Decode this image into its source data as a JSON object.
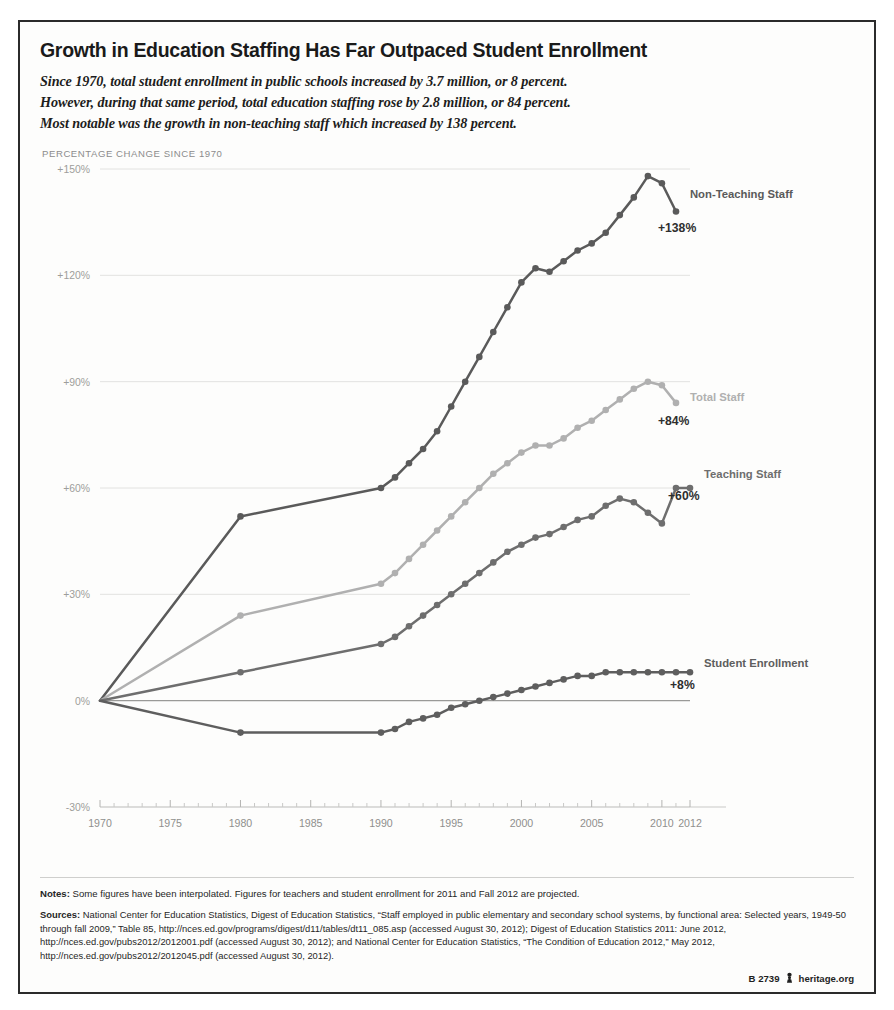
{
  "header": {
    "title": "Growth in Education Staffing Has Far Outpaced Student Enrollment",
    "subtitle_line1": "Since 1970, total student enrollment in public schools increased by 3.7 million, or 8 percent.",
    "subtitle_line2": "However, during that same period, total education staffing rose by 2.8 million, or 84 percent.",
    "subtitle_line3": "Most notable was the growth in non-teaching staff which increased by 138 percent."
  },
  "axis_caption": "PERCENTAGE CHANGE SINCE 1970",
  "footer": {
    "notes_label": "Notes:",
    "notes_text": "Some figures have been interpolated. Figures for teachers and student enrollment for 2011 and Fall 2012 are projected.",
    "sources_label": "Sources:",
    "sources_text": "National Center for Education Statistics, Digest of Education Statistics, “Staff employed in public elementary and secondary school systems, by functional area: Selected years, 1949-50 through fall 2009,” Table 85, http://nces.ed.gov/programs/digest/d11/tables/dt11_085.asp (accessed August 30, 2012); Digest of Education Statistics 2011: June 2012, http://nces.ed.gov/pubs2012/2012001.pdf (accessed August 30, 2012); and National Center for Education Statistics, “The Condition of Education 2012,” May 2012, http://nces.ed.gov/pubs2012/2012045.pdf (accessed August 30, 2012).",
    "chart_id": "B 2739",
    "org": "heritage.org",
    "pawn_icon": "pawn-icon"
  },
  "chart_data": {
    "type": "line",
    "title": "Growth in Education Staffing Has Far Outpaced Student Enrollment",
    "xlabel": "",
    "ylabel": "PERCENTAGE CHANGE SINCE 1970",
    "xlim": [
      1970,
      2012
    ],
    "ylim": [
      -30,
      150
    ],
    "yticks": [
      -30,
      0,
      30,
      60,
      90,
      120,
      150
    ],
    "ytick_labels": [
      "-30%",
      "0%",
      "+30%",
      "+60%",
      "+90%",
      "+120%",
      "+150%"
    ],
    "xticks": [
      1970,
      1975,
      1980,
      1985,
      1990,
      1995,
      2000,
      2005,
      2010,
      2012
    ],
    "xtick_labels": [
      "1970",
      "1975",
      "1980",
      "1985",
      "1990",
      "1995",
      "2000",
      "2005",
      "2010",
      "2012"
    ],
    "xtick_sublabel": "(Fall)",
    "grid": true,
    "legend_position": "right-inline",
    "series": [
      {
        "name": "Non-Teaching Staff",
        "color": "#5a5a5a",
        "end_label": "+138%",
        "end_value": 138,
        "x": [
          1970,
          1980,
          1990,
          1991,
          1992,
          1993,
          1994,
          1995,
          1996,
          1997,
          1998,
          1999,
          2000,
          2001,
          2002,
          2003,
          2004,
          2005,
          2006,
          2007,
          2008,
          2009,
          2010,
          2011
        ],
        "values": [
          0,
          52,
          60,
          63,
          67,
          71,
          76,
          83,
          90,
          97,
          104,
          111,
          118,
          122,
          121,
          124,
          127,
          129,
          132,
          137,
          142,
          148,
          146,
          138
        ]
      },
      {
        "name": "Total Staff",
        "color": "#b0b0b0",
        "end_label": "+84%",
        "end_value": 84,
        "x": [
          1970,
          1980,
          1990,
          1991,
          1992,
          1993,
          1994,
          1995,
          1996,
          1997,
          1998,
          1999,
          2000,
          2001,
          2002,
          2003,
          2004,
          2005,
          2006,
          2007,
          2008,
          2009,
          2010,
          2011
        ],
        "values": [
          0,
          24,
          33,
          36,
          40,
          44,
          48,
          52,
          56,
          60,
          64,
          67,
          70,
          72,
          72,
          74,
          77,
          79,
          82,
          85,
          88,
          90,
          89,
          84
        ]
      },
      {
        "name": "Teaching Staff",
        "color": "#6e6e6e",
        "end_label": "+60%",
        "end_value": 60,
        "x": [
          1970,
          1980,
          1990,
          1991,
          1992,
          1993,
          1994,
          1995,
          1996,
          1997,
          1998,
          1999,
          2000,
          2001,
          2002,
          2003,
          2004,
          2005,
          2006,
          2007,
          2008,
          2009,
          2010,
          2011,
          2012
        ],
        "values": [
          0,
          8,
          16,
          18,
          21,
          24,
          27,
          30,
          33,
          36,
          39,
          42,
          44,
          46,
          47,
          49,
          51,
          52,
          55,
          57,
          56,
          53,
          50,
          60,
          60
        ]
      },
      {
        "name": "Student Enrollment",
        "color": "#5e5e5e",
        "end_label": "+8%",
        "end_value": 8,
        "x": [
          1970,
          1980,
          1990,
          1991,
          1992,
          1993,
          1994,
          1995,
          1996,
          1997,
          1998,
          1999,
          2000,
          2001,
          2002,
          2003,
          2004,
          2005,
          2006,
          2007,
          2008,
          2009,
          2010,
          2011,
          2012
        ],
        "values": [
          0,
          -9,
          -9,
          -8,
          -6,
          -5,
          -4,
          -2,
          -1,
          0,
          1,
          2,
          3,
          4,
          5,
          6,
          7,
          7,
          8,
          8,
          8,
          8,
          8,
          8,
          8
        ]
      }
    ]
  }
}
